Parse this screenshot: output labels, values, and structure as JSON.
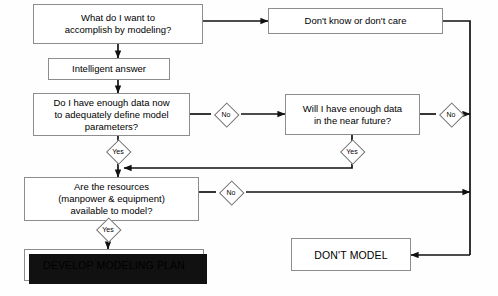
{
  "diagram": {
    "background": "#fefefe",
    "line_color": "#111111",
    "box_border": "#8d8d8d",
    "nodes": {
      "goal": "What do I want to\naccomplish by modeling?",
      "answer": "Intelligent answer",
      "dont_know": "Don't know or don't care",
      "data_now": "Do I have enough data now\nto adequately define model\nparameters?",
      "data_future": "Will I have enough data\nin the near future?",
      "resources": "Are the resources\n(manpower & equipment)\navailable to model?",
      "develop": "DEVELOP MODELING PLAN",
      "dont_model": "DON'T MODEL"
    },
    "decisions": {
      "data_now_no": "No",
      "data_now_yes": "Yes",
      "data_future_no": "No",
      "data_future_yes": "Yes",
      "resources_no": "No",
      "resources_yes": "Yes"
    }
  }
}
